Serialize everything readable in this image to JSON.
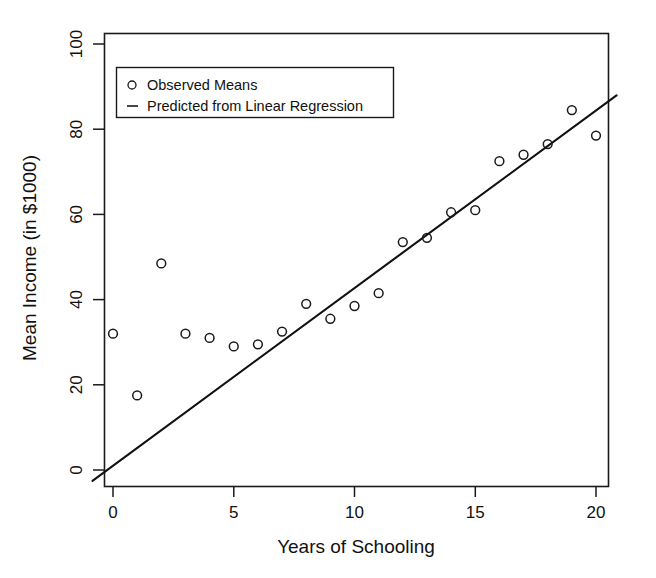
{
  "chart_data": {
    "type": "scatter",
    "title": "",
    "xlabel": "Years of Schooling",
    "ylabel": "Mean Income (in $1000)",
    "xlim": [
      -0.85,
      20.85
    ],
    "ylim": [
      -4,
      103
    ],
    "xticks": [
      0,
      5,
      10,
      15,
      20
    ],
    "xtick_labels": [
      "0",
      "5",
      "10",
      "15",
      "20"
    ],
    "yticks": [
      0,
      20,
      40,
      60,
      80,
      100
    ],
    "ytick_labels": [
      "0",
      "20",
      "40",
      "60",
      "80",
      "100"
    ],
    "grid": false,
    "legend_position": "top-left",
    "series": [
      {
        "name": "Observed Means",
        "marker": "circle-open",
        "x": [
          0,
          1,
          2,
          3,
          4,
          5,
          6,
          7,
          8,
          9,
          10,
          11,
          12,
          13,
          14,
          15,
          16,
          17,
          18,
          19,
          20
        ],
        "values": [
          32.0,
          17.5,
          48.5,
          32.0,
          31.0,
          29.0,
          29.5,
          32.5,
          39.0,
          35.5,
          38.5,
          41.5,
          53.5,
          54.5,
          60.5,
          61.0,
          72.5,
          74.0,
          76.5,
          84.5,
          78.5
        ]
      },
      {
        "name": "Predicted from Linear Regression",
        "marker": "line",
        "slope": 4.17,
        "intercept": 1.0,
        "x_range": [
          -0.85,
          20.85
        ],
        "y_range": [
          -2.5,
          87.9
        ]
      }
    ]
  },
  "legend": {
    "entries": [
      {
        "marker": "circle-open",
        "label": "Observed Means"
      },
      {
        "marker": "dash",
        "label": "Predicted from Linear Regression"
      }
    ]
  },
  "axes": {
    "x_title": "Years of Schooling",
    "y_title": "Mean Income (in $1000)",
    "x_tick_labels": [
      "0",
      "5",
      "10",
      "15",
      "20"
    ],
    "y_tick_labels": [
      "0",
      "20",
      "40",
      "60",
      "80",
      "100"
    ]
  },
  "colors": {
    "ink": "#1a1a1a",
    "background": "#ffffff"
  }
}
